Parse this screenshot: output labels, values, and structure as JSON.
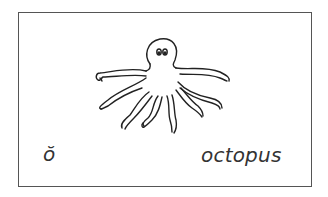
{
  "card": {
    "letter": "ŏ",
    "word": "octopus",
    "illustration": "octopus-drawing",
    "border_color": "#555555",
    "text_color": "#333333"
  }
}
